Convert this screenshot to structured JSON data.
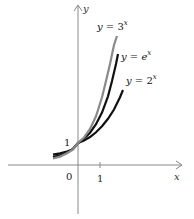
{
  "figure": {
    "axes": {
      "x_label": "x",
      "y_label": "y",
      "origin_label": "0",
      "x_tick_label": "1",
      "y_tick_label": "1"
    },
    "curves": [
      {
        "name": "three_pow_x",
        "label": "y = 3",
        "exponent": "x",
        "color": "#8a8a8a",
        "base": 3
      },
      {
        "name": "e_pow_x",
        "label": "y = e",
        "exponent": "x",
        "color": "#111111",
        "base": 2.718
      },
      {
        "name": "two_pow_x",
        "label": "y = 2",
        "exponent": "x",
        "color": "#111111",
        "base": 2
      }
    ]
  }
}
